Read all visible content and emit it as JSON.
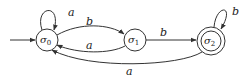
{
  "diagram": {
    "type": "finite-state-automaton",
    "states": [
      {
        "id": "s0",
        "name": "σ",
        "subscript": "0",
        "initial": true,
        "accepting": false
      },
      {
        "id": "s1",
        "name": "σ",
        "subscript": "1",
        "initial": false,
        "accepting": false
      },
      {
        "id": "s2",
        "name": "σ",
        "subscript": "2",
        "initial": false,
        "accepting": true
      }
    ],
    "transitions": [
      {
        "from": "s0",
        "to": "s0",
        "label": "a"
      },
      {
        "from": "s0",
        "to": "s1",
        "label": "b"
      },
      {
        "from": "s1",
        "to": "s0",
        "label": "a"
      },
      {
        "from": "s1",
        "to": "s2",
        "label": "b"
      },
      {
        "from": "s2",
        "to": "s2",
        "label": "b"
      },
      {
        "from": "s2",
        "to": "s0",
        "label": "a"
      }
    ],
    "labels": {
      "s0_loop": "a",
      "s0_to_s1": "b",
      "s1_to_s0": "a",
      "s1_to_s2": "b",
      "s2_loop": "b",
      "s2_to_s0": "a"
    },
    "colors": {
      "stroke": "#333333",
      "background": "#ffffff"
    }
  }
}
